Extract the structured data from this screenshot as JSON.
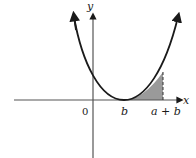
{
  "diagram": {
    "axes": {
      "x_label": "x",
      "y_label": "y",
      "origin_label": "0"
    },
    "ticks": {
      "b": "b",
      "a_plus_b": "a + b"
    },
    "curve": "parabola with vertex at (b, 0) opening upward",
    "shaded_region": "area under curve from x = b to x = a + b",
    "colors": {
      "curve": "#1a1a1a",
      "axis": "#555555",
      "shade": "#9a9a9a"
    }
  }
}
